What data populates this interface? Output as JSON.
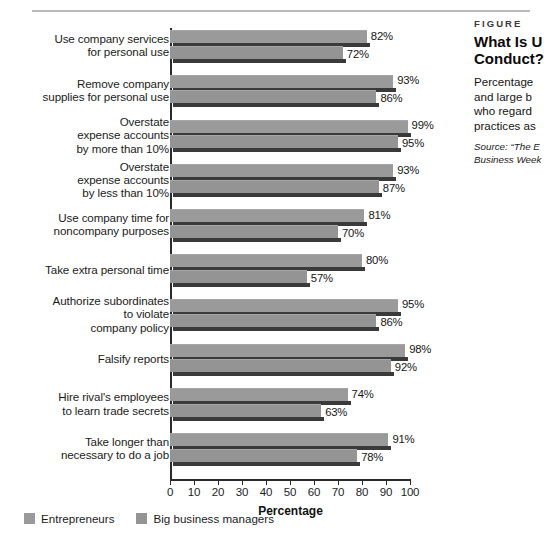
{
  "chart_data": {
    "type": "bar",
    "orientation": "horizontal",
    "xlabel": "Percentage",
    "ylabel": "",
    "xlim": [
      0,
      100
    ],
    "xticks": [
      0,
      10,
      20,
      30,
      40,
      50,
      60,
      70,
      80,
      90,
      100
    ],
    "grid": false,
    "legend_position": "bottom-left",
    "categories": [
      "Use company services for personal use",
      "Remove company supplies for personal use",
      "Overstate expense accounts by more than 10%",
      "Overstate expense accounts by less than 10%",
      "Use company time for noncompany purposes",
      "Take extra personal time",
      "Authorize subordinates to violate company policy",
      "Falsify reports",
      "Hire rival's employees to learn trade secrets",
      "Take longer than necessary to do a job"
    ],
    "series": [
      {
        "name": "Entrepreneurs",
        "color": "#9a9a9a",
        "values": [
          82,
          93,
          99,
          93,
          81,
          80,
          95,
          98,
          74,
          91
        ],
        "labels": [
          "82%",
          "93%",
          "99%",
          "93%",
          "81%",
          "80%",
          "95%",
          "98%",
          "74%",
          "91%"
        ]
      },
      {
        "name": "Big business managers",
        "color": "#949494",
        "values": [
          72,
          86,
          95,
          87,
          70,
          57,
          86,
          92,
          63,
          78
        ],
        "labels": [
          "72%",
          "86%",
          "95%",
          "87%",
          "70%",
          "57%",
          "86%",
          "92%",
          "63%",
          "78%"
        ]
      }
    ]
  },
  "axis": {
    "tick_labels": [
      "0",
      "10",
      "20",
      "30",
      "40",
      "50",
      "60",
      "70",
      "80",
      "90",
      "100"
    ],
    "x_title": "Percentage"
  },
  "categories_display": [
    [
      "Use company services",
      "for personal use"
    ],
    [
      "Remove company",
      "supplies for personal use"
    ],
    [
      "Overstate",
      "expense accounts",
      "by more than 10%"
    ],
    [
      "Overstate",
      "expense accounts",
      "by less than 10%"
    ],
    [
      "Use company time for",
      "noncompany purposes"
    ],
    [
      "Take extra personal time"
    ],
    [
      "Authorize subordinates",
      "to violate",
      "company policy"
    ],
    [
      "Falsify reports"
    ],
    [
      "Hire rival's employees",
      "to learn trade secrets"
    ],
    [
      "Take longer than",
      "necessary to do a job"
    ]
  ],
  "legend": {
    "items": [
      {
        "label": "Entrepreneurs",
        "color": "#9a9a9a"
      },
      {
        "label": "Big business managers",
        "color": "#949494"
      }
    ]
  },
  "panel": {
    "kicker": "FIGURE",
    "title_line1": "What Is U",
    "title_line2": "Conduct?",
    "body_line1": "Percentage",
    "body_line2": "and large b",
    "body_line3": "who regard",
    "body_line4": "practices as",
    "source_line1": "Source: “The E",
    "source_line2": "Business Week"
  },
  "colors": {
    "series_a": "#9a9a9a",
    "series_b": "#949494",
    "shadow": "#3a3a3a",
    "axis": "#2b2b2b",
    "text": "#1b1b1b",
    "rule": "#b9b9b9",
    "background": "#ffffff"
  }
}
